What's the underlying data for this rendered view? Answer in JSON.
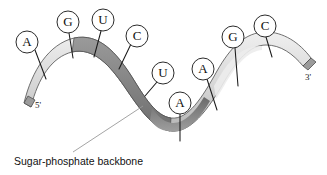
{
  "diagram": {
    "caption": "Sugar-phosphate backbone",
    "ends": {
      "five_prime": "5'",
      "three_prime": "3'"
    },
    "colors": {
      "ribbon_top": "#d8d8d8",
      "ribbon_shadow": "#8f8f8f",
      "ribbon_edge": "#5a5a5a",
      "outline": "#2b2b2b",
      "text": "#111111",
      "caption_leader": "#9a9a9a",
      "background": "#ffffff"
    },
    "bases": [
      {
        "label": "A",
        "cx": 27,
        "cy": 42,
        "r": 11,
        "tx": 46,
        "ty": 79
      },
      {
        "label": "G",
        "cx": 68,
        "cy": 22,
        "r": 11,
        "tx": 73,
        "ty": 58
      },
      {
        "label": "U",
        "cx": 103,
        "cy": 20,
        "r": 11,
        "tx": 94,
        "ty": 57
      },
      {
        "label": "C",
        "cx": 137,
        "cy": 36,
        "r": 11,
        "tx": 119,
        "ty": 69
      },
      {
        "label": "U",
        "cx": 163,
        "cy": 73,
        "r": 11,
        "tx": 145,
        "ty": 96
      },
      {
        "label": "A",
        "cx": 180,
        "cy": 103,
        "r": 11,
        "tx": 180,
        "ty": 141
      },
      {
        "label": "A",
        "cx": 203,
        "cy": 69,
        "r": 11,
        "tx": 217,
        "ty": 110
      },
      {
        "label": "G",
        "cx": 233,
        "cy": 37,
        "r": 11,
        "tx": 238,
        "ty": 86
      },
      {
        "label": "C",
        "cx": 265,
        "cy": 26,
        "r": 11,
        "tx": 272,
        "ty": 57
      }
    ]
  }
}
